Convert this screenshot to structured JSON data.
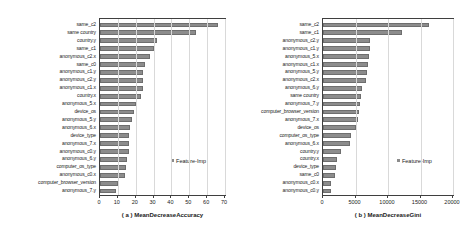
{
  "figure": {
    "background": "#ffffff",
    "bar_color": "#8c8c8c",
    "axis_color": "#3f3f3f",
    "grid_color": "#d9d9d9"
  },
  "chart_data": [
    {
      "type": "bar",
      "orientation": "horizontal",
      "panel": "a",
      "title": "",
      "xlabel": "( a ) MeanDecreaseAccuracy",
      "ylabel": "",
      "xlim": [
        0,
        70
      ],
      "xticks": [
        0,
        10,
        20,
        30,
        40,
        50,
        60,
        70
      ],
      "xticklabels": [
        "0",
        "10",
        "20",
        "30",
        "40",
        "50",
        "60",
        "70"
      ],
      "grid": true,
      "legend": [
        "Feature-Imp"
      ],
      "legend_position": "center-right",
      "categories": [
        "same_c2",
        "same country",
        "country.y",
        "same_c1",
        "anonymous_c2.x",
        "same_c0",
        "anonymous_c1.y",
        "anonymous_c2.y",
        "anonymous_c1.x",
        "country.x",
        "anonymous_5.x",
        "device_os",
        "anonymous_5.y",
        "anonymous_6.x",
        "device_type",
        "anonymous_7.x",
        "anonymous_c0.y",
        "anonymous_6.y",
        "computer_os_type",
        "anonymous_c0.x",
        "computer_browser_version",
        "anonymous_7.y"
      ],
      "values": [
        66,
        54,
        32,
        30,
        28,
        25,
        24,
        24,
        24,
        23,
        20,
        19,
        18,
        17,
        16.5,
        16,
        16,
        15,
        14.5,
        14,
        10,
        9
      ]
    },
    {
      "type": "bar",
      "orientation": "horizontal",
      "panel": "b",
      "title": "",
      "xlabel": "( b ) MeanDecreaseGini",
      "ylabel": "",
      "xlim": [
        0,
        20000
      ],
      "xticks": [
        0,
        5000,
        10000,
        15000,
        20000
      ],
      "xticklabels": [
        "0",
        "5000",
        "10000",
        "15000",
        "20000"
      ],
      "grid": true,
      "legend": [
        "Feature-Imp"
      ],
      "legend_position": "center-right",
      "categories": [
        "same_c2",
        "same_c1",
        "anonymous_c2.y",
        "anonymous_c1.y",
        "anonymous_5.x",
        "anonymous_c1.x",
        "anonymous_5.y",
        "anonymous_c2.x",
        "anonymous_6.y",
        "same country",
        "anonymous_7.y",
        "computer_browser_version",
        "anonymous_7.x",
        "device_os",
        "computer_os_type",
        "anonymous_6.x",
        "country.y",
        "country.x",
        "device_type",
        "same_c0",
        "anonymous_c0.x",
        "anonymous_c0.y"
      ],
      "values": [
        16300,
        12200,
        7300,
        7200,
        7100,
        6900,
        6700,
        6600,
        6000,
        5800,
        5700,
        5500,
        5400,
        5100,
        4300,
        4200,
        2700,
        2200,
        2000,
        1900,
        1300,
        1200
      ]
    }
  ]
}
